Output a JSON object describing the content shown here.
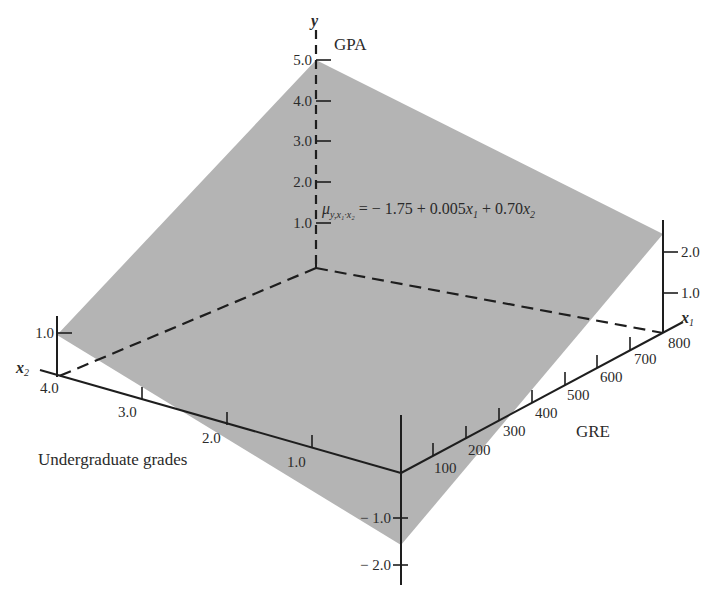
{
  "figure": {
    "type": "3d-regression-plane",
    "colors": {
      "plane": "#b4b4b4",
      "axis": "#1e1e1e",
      "text": "#2a2a2a",
      "background": "#ffffff"
    },
    "y_axis": {
      "symbol": "y",
      "name": "GPA",
      "ticks": [
        "5.0",
        "4.0",
        "3.0",
        "2.0",
        "1.0"
      ]
    },
    "x1_axis": {
      "symbol": "x",
      "subscript": "1",
      "name": "GRE",
      "ticks": [
        "100",
        "200",
        "300",
        "400",
        "500",
        "600",
        "700",
        "800"
      ]
    },
    "x2_axis": {
      "symbol": "x",
      "subscript": "2",
      "name": "Undergraduate grades",
      "ticks": [
        "4.0",
        "3.0",
        "2.0",
        "1.0"
      ]
    },
    "corner_left_axis": {
      "ticks": [
        "1.0"
      ]
    },
    "corner_right_axis": {
      "ticks": [
        "2.0",
        "1.0"
      ]
    },
    "front_axis": {
      "ticks": [
        "− 1.0",
        "− 2.0"
      ]
    },
    "equation": {
      "mu": "μ",
      "mu_sub": "y,x₁·x₂",
      "rhs_1": " = − 1.75 + 0.005",
      "x1": "x",
      "x1_sub": "1",
      "rhs_2": " + 0.70",
      "x2": "x",
      "x2_sub": "2"
    }
  }
}
